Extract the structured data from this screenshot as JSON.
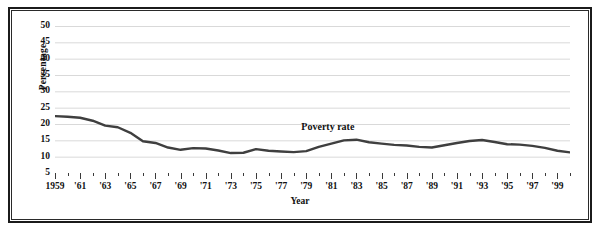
{
  "figure": {
    "background": "#ffffff",
    "frame_color": "#1b1b1b"
  },
  "chart_data": {
    "type": "line",
    "title": "",
    "subtitle": "",
    "xlabel": "Year",
    "ylabel": "Percentage",
    "xlim": [
      1959,
      2000
    ],
    "ylim": [
      0,
      52
    ],
    "yticks": [
      50,
      45,
      40,
      35,
      30,
      25,
      20,
      15,
      10,
      5
    ],
    "grid": "horizontal",
    "legend_position": "inline-annotation",
    "line_color": "#3f3f3f",
    "grid_color": "#d9d9d9",
    "annotations": [
      {
        "text": "Poverty rate",
        "x": 1981,
        "y": 19.0
      }
    ],
    "xtick_labels": [
      "1959",
      "'61",
      "'63",
      "'65",
      "'67",
      "'69",
      "'71",
      "'73",
      "'75",
      "'77",
      "'79",
      "'81",
      "'83",
      "'85",
      "'87",
      "'89",
      "'91",
      "'93",
      "'95",
      "'97",
      "'99"
    ],
    "xtick_years": [
      1959,
      1961,
      1963,
      1965,
      1967,
      1969,
      1971,
      1973,
      1975,
      1977,
      1979,
      1981,
      1983,
      1985,
      1987,
      1989,
      1991,
      1993,
      1995,
      1997,
      1999
    ],
    "series": [
      {
        "name": "Poverty rate",
        "x": [
          1959,
          1960,
          1961,
          1962,
          1963,
          1964,
          1965,
          1966,
          1967,
          1968,
          1969,
          1970,
          1971,
          1972,
          1973,
          1974,
          1975,
          1976,
          1977,
          1978,
          1979,
          1980,
          1981,
          1982,
          1983,
          1984,
          1985,
          1986,
          1987,
          1988,
          1989,
          1990,
          1991,
          1992,
          1993,
          1994,
          1995,
          1996,
          1997,
          1998,
          1999,
          2000
        ],
        "values": [
          22.4,
          22.2,
          21.9,
          21.0,
          19.5,
          19.0,
          17.3,
          14.7,
          14.2,
          12.8,
          12.1,
          12.6,
          12.5,
          11.9,
          11.1,
          11.2,
          12.3,
          11.8,
          11.6,
          11.4,
          11.7,
          13.0,
          14.0,
          15.0,
          15.2,
          14.4,
          14.0,
          13.6,
          13.4,
          13.0,
          12.8,
          13.5,
          14.2,
          14.8,
          15.1,
          14.5,
          13.8,
          13.7,
          13.3,
          12.7,
          11.8,
          11.3
        ]
      }
    ]
  }
}
